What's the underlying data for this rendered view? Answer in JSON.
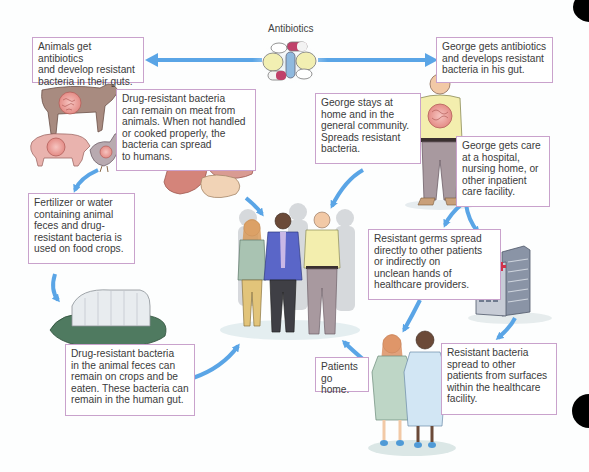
{
  "center_label": "Antibiotics",
  "colors": {
    "arrow": "#5aa5e6",
    "box_border": "#c9a2cc",
    "text": "#3b3b3b"
  },
  "boxes": {
    "animals_get_antibiotics": "Animals get antibiotics\nand develop resistant\nbacteria in their guts.",
    "george_gets_antibiotics": "George gets antibiotics\nand develops resistant\nbacteria in his gut.",
    "meat": "Drug-resistant bacteria\ncan remain on meat from\nanimals. When not handled\nor cooked properly, the\nbacteria can spread\nto humans.",
    "george_stays_home": "George stays at\nhome and in the\ngeneral community.\nSpreads resistant\nbacteria.",
    "george_gets_care": "George gets care\nat a hospital,\nnursing home, or\nother inpatient\ncare facility.",
    "fertilizer": "Fertilizer or water\ncontaining animal\nfeces and drug-\nresistant bacteria is\nused on food crops.",
    "germs_spread": "Resistant germs spread\ndirectly to other patients\nor indirectly on\nunclean hands of\nhealthcare providers.",
    "crops": "Drug-resistant bacteria\nin the animal feces can\nremain on crops and be\neaten. These bacteria can\nremain in the human gut.",
    "patients_go_home": "Patients\ngo home.",
    "surfaces": "Resistant bacteria\nspread to other\npatients from surfaces\nwithin the healthcare\nfacility."
  },
  "illustrations": [
    "antibiotic-pills",
    "cow",
    "pig",
    "chicken",
    "meat-cuts",
    "george",
    "community-people",
    "greenhouse-crops",
    "hospital-building",
    "patients-in-gowns"
  ]
}
